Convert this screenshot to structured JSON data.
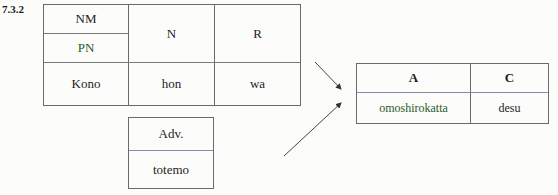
{
  "section_label": "7.3.2",
  "main_table": {
    "header": {
      "col1_top": "NM",
      "col1_bottom": "PN",
      "col2": "N",
      "col3": "R"
    },
    "row": [
      "Kono",
      "hon",
      "wa"
    ]
  },
  "adverb_table": {
    "header": "Adv.",
    "value": "totemo"
  },
  "result_table": {
    "headers": [
      "A",
      "C"
    ],
    "row": [
      "omoshirokatta",
      "desu"
    ]
  },
  "arrows": [
    {
      "from": "main_table",
      "to": "result_table",
      "direction": "down-right"
    },
    {
      "from": "adverb_table",
      "to": "result_table",
      "direction": "up-right"
    }
  ]
}
